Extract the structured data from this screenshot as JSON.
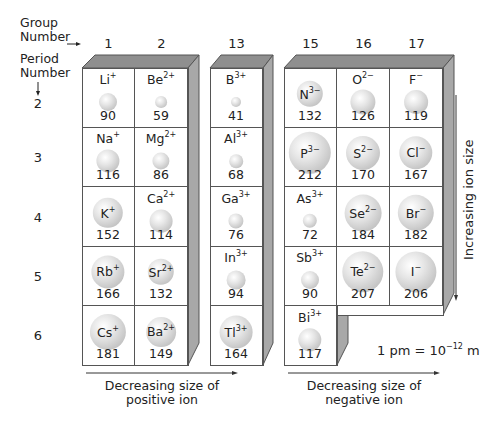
{
  "labels": {
    "group_number": [
      "Group",
      "Number"
    ],
    "period_number": [
      "Period",
      "Number"
    ],
    "groups": [
      "1",
      "2",
      "13",
      "15",
      "16",
      "17"
    ],
    "periods": [
      "2",
      "3",
      "4",
      "5",
      "6"
    ],
    "positive_arrow": [
      "Decreasing size of",
      "positive ion"
    ],
    "negative_arrow": [
      "Decreasing size of",
      "negative ion"
    ],
    "vertical_arrow": "Increasing ion size",
    "unit_note": {
      "prefix": "1 pm = 10",
      "exp": "−12",
      "suffix": " m"
    }
  },
  "colors": {
    "face_top": "#8f8f8f",
    "face_side": "#a8a8a8",
    "border": "#555555",
    "sphere_light": "#ffffff",
    "sphere_dark": "#a9a9a9"
  },
  "ions": [
    {
      "group": "1",
      "period": "2",
      "symbol": "Li",
      "charge": "+",
      "radius_pm": 90
    },
    {
      "group": "2",
      "period": "2",
      "symbol": "Be",
      "charge": "2+",
      "radius_pm": 59
    },
    {
      "group": "13",
      "period": "2",
      "symbol": "B",
      "charge": "3+",
      "radius_pm": 41
    },
    {
      "group": "15",
      "period": "2",
      "symbol": "N",
      "charge": "3−",
      "radius_pm": 132
    },
    {
      "group": "16",
      "period": "2",
      "symbol": "O",
      "charge": "2−",
      "radius_pm": 126
    },
    {
      "group": "17",
      "period": "2",
      "symbol": "F",
      "charge": "−",
      "radius_pm": 119
    },
    {
      "group": "1",
      "period": "3",
      "symbol": "Na",
      "charge": "+",
      "radius_pm": 116
    },
    {
      "group": "2",
      "period": "3",
      "symbol": "Mg",
      "charge": "2+",
      "radius_pm": 86
    },
    {
      "group": "13",
      "period": "3",
      "symbol": "Al",
      "charge": "3+",
      "radius_pm": 68
    },
    {
      "group": "15",
      "period": "3",
      "symbol": "P",
      "charge": "3−",
      "radius_pm": 212
    },
    {
      "group": "16",
      "period": "3",
      "symbol": "S",
      "charge": "2−",
      "radius_pm": 170
    },
    {
      "group": "17",
      "period": "3",
      "symbol": "Cl",
      "charge": "−",
      "radius_pm": 167
    },
    {
      "group": "1",
      "period": "4",
      "symbol": "K",
      "charge": "+",
      "radius_pm": 152
    },
    {
      "group": "2",
      "period": "4",
      "symbol": "Ca",
      "charge": "2+",
      "radius_pm": 114
    },
    {
      "group": "13",
      "period": "4",
      "symbol": "Ga",
      "charge": "3+",
      "radius_pm": 76
    },
    {
      "group": "15",
      "period": "4",
      "symbol": "As",
      "charge": "3+",
      "radius_pm": 72
    },
    {
      "group": "16",
      "period": "4",
      "symbol": "Se",
      "charge": "2−",
      "radius_pm": 184
    },
    {
      "group": "17",
      "period": "4",
      "symbol": "Br",
      "charge": "−",
      "radius_pm": 182
    },
    {
      "group": "1",
      "period": "5",
      "symbol": "Rb",
      "charge": "+",
      "radius_pm": 166
    },
    {
      "group": "2",
      "period": "5",
      "symbol": "Sr",
      "charge": "2+",
      "radius_pm": 132
    },
    {
      "group": "13",
      "period": "5",
      "symbol": "In",
      "charge": "3+",
      "radius_pm": 94
    },
    {
      "group": "15",
      "period": "5",
      "symbol": "Sb",
      "charge": "3+",
      "radius_pm": 90
    },
    {
      "group": "16",
      "period": "5",
      "symbol": "Te",
      "charge": "2−",
      "radius_pm": 207
    },
    {
      "group": "17",
      "period": "5",
      "symbol": "I",
      "charge": "−",
      "radius_pm": 206
    },
    {
      "group": "1",
      "period": "6",
      "symbol": "Cs",
      "charge": "+",
      "radius_pm": 181
    },
    {
      "group": "2",
      "period": "6",
      "symbol": "Ba",
      "charge": "2+",
      "radius_pm": 149
    },
    {
      "group": "13",
      "period": "6",
      "symbol": "Tl",
      "charge": "3+",
      "radius_pm": 164
    },
    {
      "group": "15",
      "period": "6",
      "symbol": "Bi",
      "charge": "3+",
      "radius_pm": 117
    }
  ]
}
